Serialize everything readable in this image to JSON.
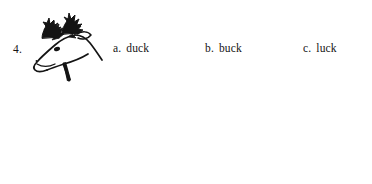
{
  "page": {
    "background_color": "#ffffff",
    "ink_color": "#141414"
  },
  "questions": [
    {
      "number": "4.",
      "image": {
        "name": "deer-head-illustration",
        "description": "Black ink line drawing of a buck's head with antlers in profile facing left"
      },
      "options": [
        {
          "letter": "a.",
          "word": "duck"
        },
        {
          "letter": "b.",
          "word": "buck"
        },
        {
          "letter": "c.",
          "word": "luck"
        }
      ]
    },
    {
      "number": "5.",
      "image": {
        "name": "bird-illustration",
        "description": "Black ink line drawing of a small bird (wren) standing in profile facing left"
      },
      "options": [
        {
          "letter": "a.",
          "word": "sing"
        },
        {
          "letter": "b.",
          "word": "wing"
        },
        {
          "letter": "c.",
          "word": "wring"
        }
      ]
    }
  ]
}
